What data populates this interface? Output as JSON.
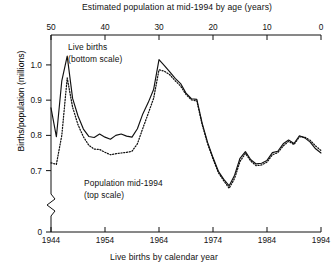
{
  "chart_data": {
    "type": "line",
    "title": "",
    "top_axis": {
      "label": "Estimated population at mid-1994 by age (years)",
      "ticks": [
        50,
        40,
        30,
        20,
        10,
        0
      ],
      "range": [
        50,
        0
      ],
      "reversed": true
    },
    "bottom_axis": {
      "label": "Live births by calendar year",
      "ticks": [
        1944,
        1954,
        1964,
        1974,
        1984,
        1994
      ],
      "range": [
        1944,
        1994
      ]
    },
    "ylabel": "Births/population (millions)",
    "yticks": [
      "0",
      "0.7",
      "0.8",
      "0.9",
      "1.0"
    ],
    "ylim": [
      0.645,
      1.048
    ],
    "axis_break": true,
    "grid": false,
    "legend_position": "inline-annotation",
    "annotations": [
      {
        "text_line1": "Live births",
        "text_line2": "(bottom scale)",
        "series": "live-births"
      },
      {
        "text_line1": "Population mid-1994",
        "text_line2": "(top scale)",
        "series": "population"
      }
    ],
    "x": [
      1944,
      1945,
      1946,
      1947,
      1948,
      1949,
      1950,
      1951,
      1952,
      1953,
      1954,
      1955,
      1956,
      1957,
      1958,
      1959,
      1960,
      1961,
      1962,
      1963,
      1964,
      1965,
      1966,
      1967,
      1968,
      1969,
      1970,
      1971,
      1972,
      1973,
      1974,
      1975,
      1976,
      1977,
      1978,
      1979,
      1980,
      1981,
      1982,
      1983,
      1984,
      1985,
      1986,
      1987,
      1988,
      1989,
      1990,
      1991,
      1992,
      1993,
      1994
    ],
    "series": [
      {
        "name": "Live births",
        "style": "solid",
        "scale": "bottom",
        "values": [
          0.878,
          0.796,
          0.955,
          1.025,
          0.905,
          0.855,
          0.818,
          0.797,
          0.794,
          0.804,
          0.795,
          0.789,
          0.8,
          0.804,
          0.798,
          0.795,
          0.819,
          0.861,
          0.893,
          0.93,
          1.015,
          0.998,
          0.98,
          0.962,
          0.947,
          0.92,
          0.904,
          0.902,
          0.834,
          0.78,
          0.737,
          0.698,
          0.675,
          0.657,
          0.687,
          0.735,
          0.754,
          0.731,
          0.719,
          0.721,
          0.729,
          0.751,
          0.755,
          0.776,
          0.787,
          0.777,
          0.799,
          0.793,
          0.781,
          0.762,
          0.75
        ]
      },
      {
        "name": "Population mid-1994",
        "style": "dotted",
        "scale": "top",
        "values": [
          0.722,
          0.718,
          0.8,
          0.963,
          0.88,
          0.83,
          0.796,
          0.772,
          0.761,
          0.76,
          0.752,
          0.745,
          0.748,
          0.75,
          0.752,
          0.755,
          0.776,
          0.82,
          0.862,
          0.905,
          0.986,
          0.982,
          0.972,
          0.955,
          0.94,
          0.916,
          0.901,
          0.898,
          0.83,
          0.776,
          0.733,
          0.694,
          0.671,
          0.65,
          0.678,
          0.726,
          0.749,
          0.727,
          0.714,
          0.716,
          0.724,
          0.745,
          0.751,
          0.77,
          0.783,
          0.774,
          0.796,
          0.795,
          0.786,
          0.77,
          0.757
        ]
      }
    ]
  }
}
